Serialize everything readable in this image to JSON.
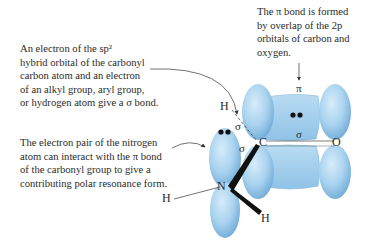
{
  "annotations": {
    "sigma_bond": {
      "lines": [
        "An electron of the sp²",
        "hybrid orbital of the carbonyl",
        "carbon atom and an electron",
        "of an alkyl group, aryl group,",
        "or hydrogen atom give a σ bond."
      ]
    },
    "nitrogen_pair": {
      "lines": [
        "The electron pair of the nitrogen",
        "atom can interact with the π bond",
        "of the carbonyl group to give a",
        "contributing polar resonance form."
      ]
    },
    "pi_bond": {
      "lines": [
        "The π bond is formed",
        "by overlap of the 2p",
        "orbitals of carbon and",
        "oxygen."
      ]
    }
  },
  "atom_labels": {
    "carbon": "C",
    "oxygen": "O",
    "nitrogen": "N",
    "hydrogen_top": "H",
    "hydrogen_left": "H",
    "hydrogen_bottom": "H"
  },
  "bond_labels": {
    "pi_top": "π",
    "sigma_co": "σ",
    "sigma_ch": "σ",
    "sigma_cn": "σ"
  },
  "colors": {
    "orbital_fill": "#a9d3ef",
    "orbital_dark": "#6fa9d6",
    "text": "#2a2a2a"
  }
}
